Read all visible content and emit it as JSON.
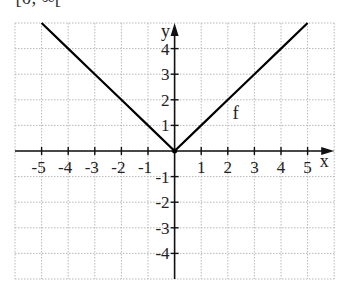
{
  "header_fragment": {
    "text": "= [0; ∞["
  },
  "chart_data": {
    "type": "line",
    "title": "",
    "xlabel": "x",
    "ylabel": "y",
    "xlim": [
      -6,
      6
    ],
    "ylim": [
      -5,
      5
    ],
    "grid": true,
    "grid_style": "dotted",
    "x_ticks": [
      -5,
      -4,
      -3,
      -2,
      -1,
      1,
      2,
      3,
      4,
      5
    ],
    "y_ticks": [
      -4,
      -3,
      -2,
      -1,
      1,
      2,
      3,
      4
    ],
    "x_tick_labels": [
      "-5",
      "-4",
      "-3",
      "-2",
      "-1",
      "1",
      "2",
      "3",
      "4",
      "5"
    ],
    "y_tick_labels": [
      "-4",
      "-3",
      "-2",
      "-1",
      "1",
      "2",
      "3",
      "4"
    ],
    "series": [
      {
        "name": "f",
        "expression": "f(x) = |x|",
        "x": [
          -5,
          -4,
          -3,
          -2,
          -1,
          0,
          1,
          2,
          3,
          4,
          5
        ],
        "y": [
          5,
          4,
          3,
          2,
          1,
          0,
          1,
          2,
          3,
          4,
          5
        ],
        "color": "#000000",
        "label_position": [
          2.3,
          1.5
        ]
      }
    ]
  },
  "layout": {
    "origin_px": [
      174.6,
      151
    ],
    "unit_x_px": 26.6,
    "unit_y_px": 25.6,
    "grid_color": "#b8b8b8",
    "axis_color": "#111111",
    "line_color": "#000000"
  }
}
